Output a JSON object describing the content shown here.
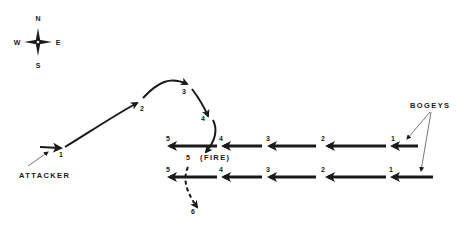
{
  "compass": {
    "north": "N",
    "south": "S",
    "east": "E",
    "west": "W"
  },
  "labels": {
    "attacker": "ATTACKER",
    "bogeys": "BOGEYS",
    "fire": "(FIRE)"
  },
  "attacker_path": {
    "points": [
      "1",
      "2",
      "3",
      "4",
      "5",
      "6"
    ]
  },
  "bogey_top": {
    "points": [
      "1",
      "2",
      "3",
      "4",
      "5"
    ]
  },
  "bogey_bottom": {
    "points": [
      "1",
      "2",
      "3",
      "4",
      "5"
    ]
  },
  "colors": {
    "ink": "#1a1a1a",
    "background": "#ffffff"
  }
}
